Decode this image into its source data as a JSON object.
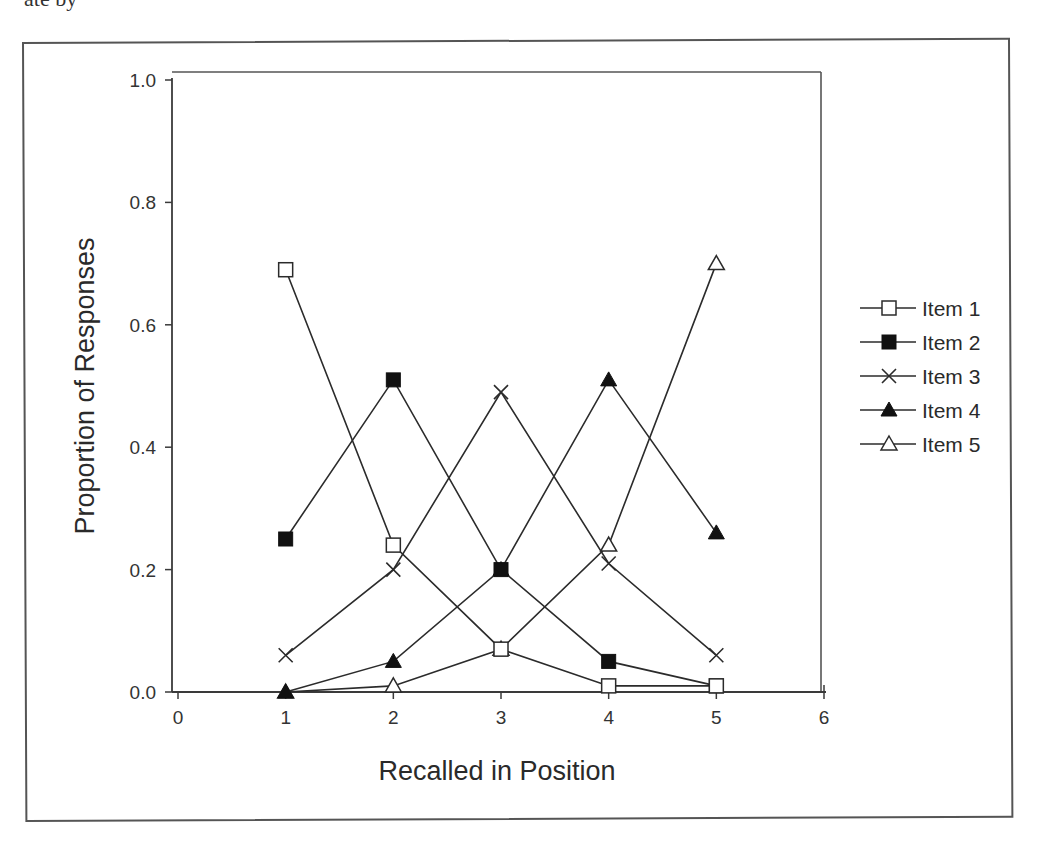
{
  "page": {
    "cut_off_text": "ate by"
  },
  "chart_data": {
    "type": "line",
    "title": "",
    "xlabel": "Recalled in Position",
    "ylabel": "Proportion of Responses",
    "xlim": [
      0,
      6
    ],
    "ylim": [
      0.0,
      1.0
    ],
    "x_ticks": [
      0,
      1,
      2,
      3,
      4,
      5,
      6
    ],
    "y_ticks": [
      0.0,
      0.2,
      0.4,
      0.6,
      0.8,
      1.0
    ],
    "x_tick_labels": [
      "0",
      "1",
      "2",
      "3",
      "4",
      "5",
      "6"
    ],
    "y_tick_labels": [
      "0.0",
      "0.2",
      "0.4",
      "0.6",
      "0.8",
      "1.0"
    ],
    "grid": false,
    "legend_position": "right",
    "x": [
      1,
      2,
      3,
      4,
      5
    ],
    "series": [
      {
        "name": "Item 1",
        "marker": "open-square",
        "values": [
          0.69,
          0.24,
          0.07,
          0.01,
          0.01
        ]
      },
      {
        "name": "Item 2",
        "marker": "filled-square",
        "values": [
          0.25,
          0.51,
          0.2,
          0.05,
          0.01
        ]
      },
      {
        "name": "Item 3",
        "marker": "x",
        "values": [
          0.06,
          0.2,
          0.49,
          0.21,
          0.06
        ]
      },
      {
        "name": "Item 4",
        "marker": "filled-triangle",
        "values": [
          0.0,
          0.05,
          0.2,
          0.51,
          0.26
        ]
      },
      {
        "name": "Item 5",
        "marker": "open-triangle",
        "values": [
          0.0,
          0.01,
          0.07,
          0.24,
          0.7
        ]
      }
    ],
    "colors": {
      "line": "#2b2b2b",
      "axis": "#3a3a3a",
      "marker_fill": "#111111",
      "background": "#ffffff"
    }
  }
}
